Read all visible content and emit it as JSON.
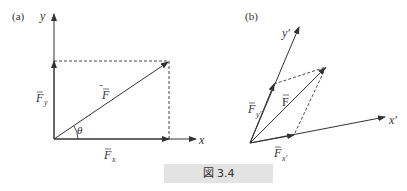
{
  "figure": {
    "caption": "図 3.4",
    "caption_bg": "#e3e3e3",
    "line_color": "#333333"
  },
  "panel_a": {
    "label": "(a)",
    "axis_x_label": "x",
    "axis_y_label": "y",
    "vector_label": "F",
    "component_x_label": "F",
    "component_x_sub": "x",
    "component_y_label": "F",
    "component_y_sub": "y",
    "angle_label": "θ"
  },
  "panel_b": {
    "label": "(b)",
    "axis_x_label": "x′",
    "axis_y_label": "y′",
    "vector_label": "F",
    "component_x_label": "F",
    "component_x_sub": "x′",
    "component_y_label": "F",
    "component_y_sub": "y′"
  }
}
